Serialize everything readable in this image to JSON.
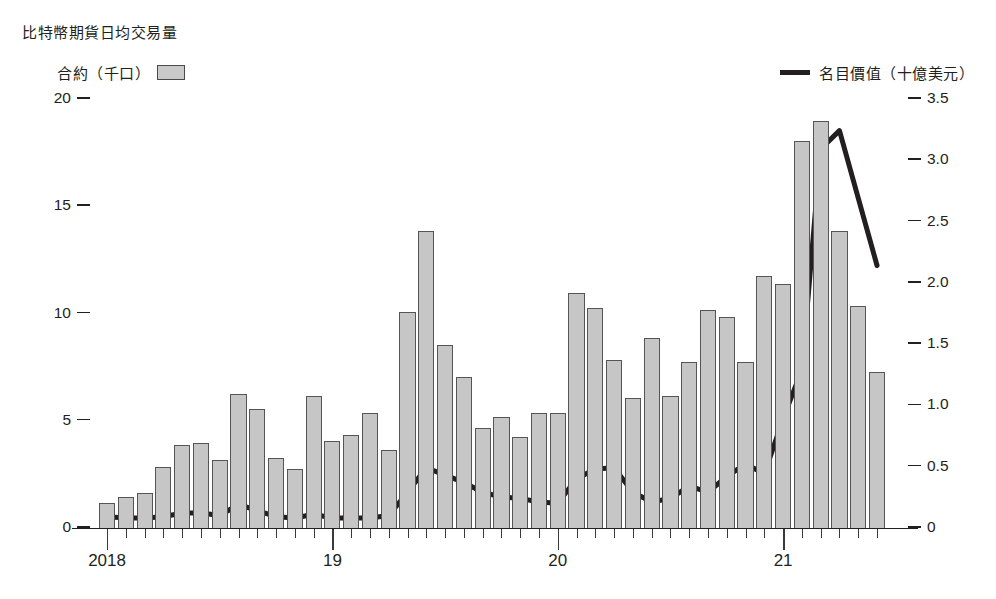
{
  "header": {
    "title": "比特幣期貨日均交易量"
  },
  "legend": {
    "bars_label": "合約（千口）",
    "bars_swatch": "bar-swatch",
    "line_label": "名目價值（十億美元）",
    "line_swatch": "line-swatch"
  },
  "axes": {
    "left_ticks": [
      "0",
      "5",
      "10",
      "15",
      "20"
    ],
    "right_ticks": [
      "0",
      "0.5",
      "1.0",
      "1.5",
      "2.0",
      "2.5",
      "3.0",
      "3.5"
    ],
    "x_ticks": [
      "2018",
      "19",
      "20",
      "21"
    ]
  },
  "colors": {
    "bar_fill": "#c6c6c6",
    "bar_stroke": "#555555",
    "line": "#231f20",
    "text": "#231f20"
  },
  "chart_data": {
    "type": "bar",
    "title": "比特幣期貨日均交易量",
    "xlabel": "",
    "ylabel": "合約（千口）",
    "y2label": "名目價值（十億美元）",
    "ylim": [
      0,
      20
    ],
    "y2lim": [
      0,
      3.5
    ],
    "grid": false,
    "legend_position": "top",
    "categories": [
      "2018-01",
      "2018-02",
      "2018-03",
      "2018-04",
      "2018-05",
      "2018-06",
      "2018-07",
      "2018-08",
      "2018-09",
      "2018-10",
      "2018-11",
      "2018-12",
      "2019-01",
      "2019-02",
      "2019-03",
      "2019-04",
      "2019-05",
      "2019-06",
      "2019-07",
      "2019-08",
      "2019-09",
      "2019-10",
      "2019-11",
      "2019-12",
      "2020-01",
      "2020-02",
      "2020-03",
      "2020-04",
      "2020-05",
      "2020-06",
      "2020-07",
      "2020-08",
      "2020-09",
      "2020-10",
      "2020-11",
      "2020-12",
      "2021-01",
      "2021-02",
      "2021-03",
      "2021-04",
      "2021-05",
      "2021-06"
    ],
    "series": [
      {
        "name": "合約（千口）",
        "type": "bar",
        "axis": "left",
        "values": [
          1.2,
          1.5,
          1.7,
          2.9,
          3.9,
          4.0,
          3.2,
          6.3,
          5.6,
          3.3,
          2.8,
          6.2,
          4.1,
          4.4,
          5.4,
          3.7,
          10.1,
          13.9,
          8.6,
          7.1,
          4.7,
          5.2,
          4.3,
          5.4,
          5.4,
          11.0,
          10.3,
          7.9,
          6.1,
          8.9,
          6.2,
          7.8,
          10.2,
          9.9,
          7.8,
          11.8,
          11.4,
          18.1,
          19.0,
          13.9,
          10.4,
          7.3
        ]
      },
      {
        "name": "名目價值（十億美元）",
        "type": "line",
        "axis": "right",
        "values": [
          0.1,
          0.09,
          0.09,
          0.1,
          0.13,
          0.13,
          0.11,
          0.2,
          0.15,
          0.1,
          0.09,
          0.12,
          0.09,
          0.09,
          0.09,
          0.11,
          0.3,
          0.5,
          0.44,
          0.38,
          0.3,
          0.26,
          0.25,
          0.22,
          0.21,
          0.41,
          0.49,
          0.5,
          0.3,
          0.22,
          0.25,
          0.35,
          0.3,
          0.43,
          0.53,
          0.45,
          0.9,
          1.3,
          3.1,
          3.25,
          2.7,
          2.15
        ]
      }
    ]
  }
}
